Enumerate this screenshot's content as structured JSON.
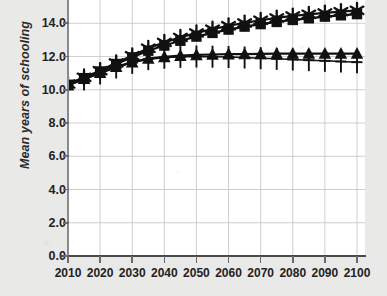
{
  "chart_data": {
    "type": "line",
    "title": "",
    "subtitle": "",
    "xlabel": "",
    "ylabel": "Mean years of schooling",
    "x": [
      2010,
      2015,
      2020,
      2025,
      2030,
      2035,
      2040,
      2045,
      2050,
      2055,
      2060,
      2065,
      2070,
      2075,
      2080,
      2085,
      2090,
      2095,
      2100
    ],
    "xtick_labels": [
      "2010",
      "2020",
      "2030",
      "2040",
      "2050",
      "2060",
      "2070",
      "2080",
      "2090",
      "2100"
    ],
    "xticks": [
      2010,
      2020,
      2030,
      2040,
      2050,
      2060,
      2070,
      2080,
      2090,
      2100
    ],
    "ytick_labels": [
      "0.0",
      "2.0",
      "4.0",
      "6.0",
      "8.0",
      "10.0",
      "12.0",
      "14.0"
    ],
    "yticks": [
      0.0,
      2.0,
      4.0,
      6.0,
      8.0,
      10.0,
      12.0,
      14.0
    ],
    "xlim": [
      2010,
      2100
    ],
    "ylim": [
      0.0,
      15.4
    ],
    "grid": true,
    "legend": "none",
    "line_color": "#111111",
    "grid_color": "#c9c9c9",
    "plot_background": "#ffffff",
    "page_background": "#e9e9e7",
    "series": [
      {
        "name": "series-star",
        "marker": "star",
        "values": [
          10.35,
          10.75,
          11.15,
          11.62,
          12.05,
          12.5,
          12.85,
          13.15,
          13.42,
          13.65,
          13.85,
          14.02,
          14.18,
          14.32,
          14.44,
          14.54,
          14.62,
          14.7,
          14.78
        ]
      },
      {
        "name": "series-square",
        "marker": "square",
        "values": [
          10.3,
          10.7,
          11.1,
          11.55,
          11.95,
          12.35,
          12.66,
          12.95,
          13.2,
          13.42,
          13.62,
          13.8,
          13.95,
          14.08,
          14.2,
          14.3,
          14.4,
          14.48,
          14.55
        ]
      },
      {
        "name": "series-triangle",
        "marker": "triangle",
        "values": [
          10.28,
          10.66,
          11.02,
          11.38,
          11.66,
          11.88,
          11.98,
          12.05,
          12.1,
          12.12,
          12.14,
          12.15,
          12.16,
          12.17,
          12.18,
          12.18,
          12.18,
          12.18,
          12.18
        ]
      },
      {
        "name": "series-plus",
        "marker": "plus",
        "values": [
          10.25,
          10.62,
          10.98,
          11.34,
          11.62,
          11.84,
          11.93,
          11.98,
          12.0,
          11.99,
          11.97,
          11.94,
          11.9,
          11.86,
          11.82,
          11.78,
          11.74,
          11.7,
          11.66
        ]
      }
    ]
  }
}
